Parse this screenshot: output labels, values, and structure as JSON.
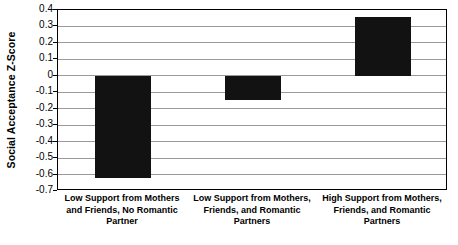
{
  "chart_data": {
    "type": "bar",
    "title": "",
    "xlabel": "",
    "ylabel": "Social Acceptance Z-Score",
    "categories": [
      "Low Support from Mothers and Friends, No Romantic Partner",
      "Low Support from Mothers, Friends, and Romantic Partners",
      "High Support from Mothers, Friends, and Romantic Partners"
    ],
    "values": [
      -0.62,
      -0.15,
      0.36
    ],
    "ylim": [
      -0.7,
      0.4
    ],
    "ytick_labels": [
      "0.4",
      "0.3",
      "0.2",
      "0.1",
      "0",
      "-0.1",
      "-0.2",
      "-0.3",
      "-0.4",
      "-0.5",
      "-0.6",
      "-0.7"
    ],
    "ytick_values": [
      0.4,
      0.3,
      0.2,
      0.1,
      0,
      -0.1,
      -0.2,
      -0.3,
      -0.4,
      -0.5,
      -0.6,
      -0.7
    ],
    "grid": true,
    "legend": false,
    "legend_position": "none",
    "bar_color": "#121212",
    "gridline_color": "#9a9a9a",
    "axis_color": "#000000",
    "background_color": "#ffffff"
  }
}
